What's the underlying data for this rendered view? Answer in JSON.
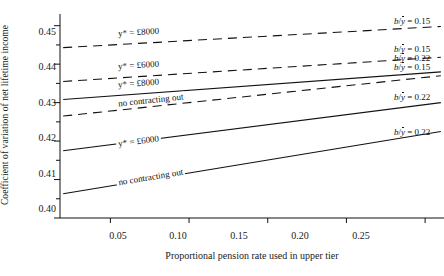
{
  "chart_data": {
    "type": "line",
    "title": "",
    "xlabel": "Proportional pension rate used in upper tier",
    "ylabel": "Coefficient of variation of net lifetime income",
    "xlim": [
      0.018,
      0.262
    ],
    "ylim": [
      0.4,
      0.452
    ],
    "grid": false,
    "legend_position": "right-of-plot-inline",
    "xticks": [
      0.05,
      0.1,
      0.15,
      0.2,
      0.25
    ],
    "xticklabels": [
      "0.05",
      "0.10",
      "0.15",
      "0.20",
      "0.25"
    ],
    "yticks": [
      0.4,
      0.41,
      0.42,
      0.43,
      0.44,
      0.45
    ],
    "yticklabels": [
      "0.40",
      "0.41",
      "0.42",
      "0.43",
      "0.44",
      "0.45"
    ],
    "yminorticks": [
      0.405,
      0.415,
      0.425,
      0.435,
      0.445
    ],
    "series": [
      {
        "name": "b/y = 0.15, y* = £8000",
        "style": "dashed",
        "x": [
          0.02,
          0.26
        ],
        "values": [
          0.4443,
          0.4498
        ],
        "label": "b/ȳ = 0.15",
        "label_numeric": "0.15"
      },
      {
        "name": "b/y = 0.15, y* = £6000",
        "style": "dashed",
        "x": [
          0.02,
          0.26
        ],
        "values": [
          0.4355,
          0.4418
        ],
        "label": "b/ȳ = 0.15",
        "label_numeric": "0.15"
      },
      {
        "name": "b/y = 0.22, y* = £8000",
        "style": "solid",
        "x": [
          0.02,
          0.26
        ],
        "values": [
          0.4308,
          0.438
        ],
        "label": "b/ȳ = 0.22",
        "label_numeric": "0.22"
      },
      {
        "name": "b/y = 0.15, no contracting out",
        "style": "dashed",
        "x": [
          0.02,
          0.26
        ],
        "values": [
          0.4265,
          0.437
        ],
        "label": "b/ȳ = 0.15",
        "label_numeric": "0.15"
      },
      {
        "name": "b/y = 0.22, y* = £6000",
        "style": "solid",
        "x": [
          0.02,
          0.26
        ],
        "values": [
          0.4175,
          0.43
        ],
        "label": "b/ȳ = 0.22",
        "label_numeric": "0.22"
      },
      {
        "name": "b/y = 0.22, no contracting out",
        "style": "solid",
        "x": [
          0.02,
          0.26
        ],
        "values": [
          0.4063,
          0.4225
        ],
        "label": "b/ȳ = 0.22",
        "label_numeric": "0.22"
      }
    ],
    "annotations": [
      {
        "text": "y* = £8000",
        "series": 0
      },
      {
        "text": "y* = £6000",
        "series": 1
      },
      {
        "text": "y* = £8000",
        "series": 2
      },
      {
        "text": "no contracting out",
        "series": 3
      },
      {
        "text": "y* = £6000",
        "series": 4
      },
      {
        "text": "no contracting out",
        "series": 5
      }
    ]
  }
}
